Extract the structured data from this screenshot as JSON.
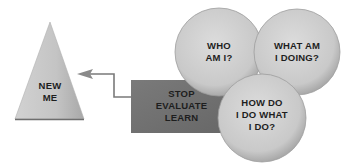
{
  "diagram": {
    "triangle": {
      "label": "NEW\nME",
      "fill": "#c8c8c8"
    },
    "box": {
      "label": "STOP\nEVALUATE\nLEARN",
      "fill": "#707070"
    },
    "circles": [
      {
        "label": "WHO\nAM I?",
        "fill": "#cdcdcd"
      },
      {
        "label": "WHAT AM\nI DOING?",
        "fill": "#cdcdcd"
      },
      {
        "label": "HOW DO\nI DO WHAT\nI DO?",
        "fill": "#cdcdcd"
      }
    ],
    "arrow": {
      "color": "#7a7a7a",
      "from": "box",
      "to": "triangle"
    }
  }
}
